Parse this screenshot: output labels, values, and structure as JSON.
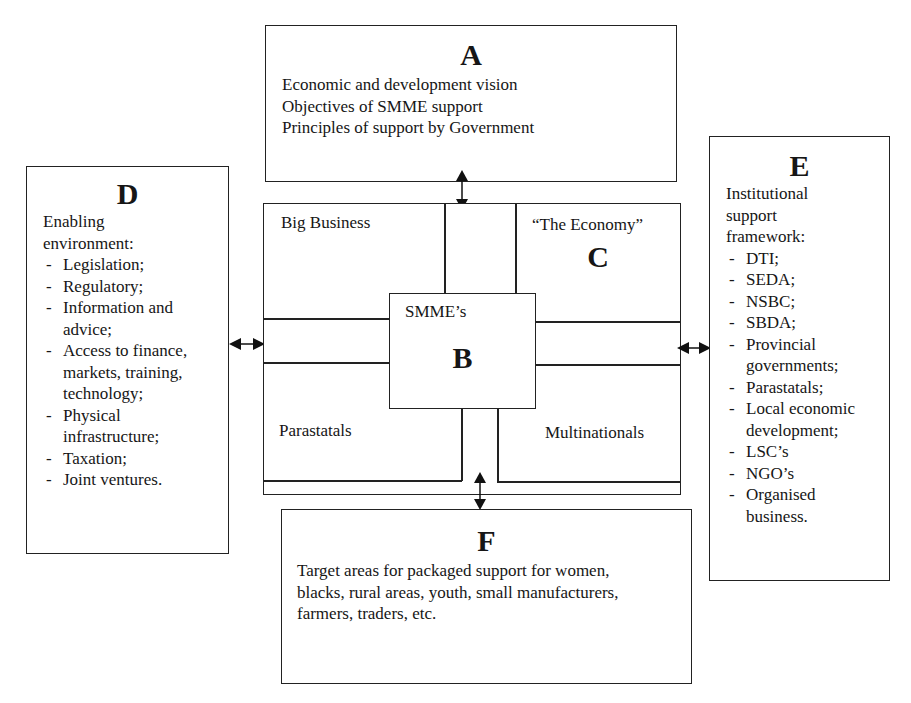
{
  "diagram": {
    "box_a": {
      "letter": "A",
      "lines": [
        "Economic and development vision",
        "Objectives of SMME support",
        "Principles of support by Government"
      ]
    },
    "box_c": {
      "letter": "C",
      "title": "“The Economy”",
      "quadrants": {
        "top_left": "Big Business",
        "bottom_left": "Parastatals",
        "bottom_right": "Multinationals"
      }
    },
    "box_b": {
      "letter": "B",
      "title": "SMME’s"
    },
    "box_d": {
      "letter": "D",
      "heading": [
        "Enabling",
        "environment:"
      ],
      "items": [
        [
          "Legislation;"
        ],
        [
          "Regulatory;"
        ],
        [
          "Information and",
          "advice;"
        ],
        [
          "Access to finance,",
          "markets, training,",
          "technology;"
        ],
        [
          "Physical",
          "infrastructure;"
        ],
        [
          "Taxation;"
        ],
        [
          "Joint ventures."
        ]
      ]
    },
    "box_e": {
      "letter": "E",
      "heading": [
        "Institutional",
        "support",
        "framework:"
      ],
      "items": [
        [
          "DTI;"
        ],
        [
          "SEDA;"
        ],
        [
          "NSBC;"
        ],
        [
          "SBDA;"
        ],
        [
          "Provincial",
          "governments;"
        ],
        [
          "Parastatals;"
        ],
        [
          "Local economic",
          "development;"
        ],
        [
          "LSC’s"
        ],
        [
          "NGO’s"
        ],
        [
          "Organised",
          "business."
        ]
      ]
    },
    "box_f": {
      "letter": "F",
      "lines": [
        "Target areas for packaged support for women,",
        "blacks, rural areas, youth, small manufacturers,",
        "farmers, traders, etc."
      ]
    },
    "arrows": [
      {
        "name": "a-c-arrow",
        "direction": "vertical-bidirectional"
      },
      {
        "name": "d-c-arrow",
        "direction": "horizontal-bidirectional"
      },
      {
        "name": "c-e-arrow",
        "direction": "horizontal-bidirectional"
      },
      {
        "name": "c-f-arrow",
        "direction": "vertical-bidirectional"
      }
    ]
  }
}
